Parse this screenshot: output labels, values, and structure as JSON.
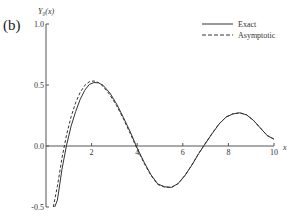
{
  "panel_label": "(b)",
  "chart_data": {
    "type": "line",
    "title": "",
    "xlabel": "x",
    "ylabel": "Y₀(x)",
    "xlim": [
      0,
      10
    ],
    "ylim": [
      -0.5,
      1.0
    ],
    "xticks": [
      2,
      4,
      6,
      8,
      10
    ],
    "xtick_labels": [
      "2",
      "4",
      "6",
      "8",
      "10"
    ],
    "yticks": [
      -0.5,
      0.0,
      0.5,
      1.0
    ],
    "ytick_labels": [
      "-0.5",
      "0.0",
      "0.5",
      "1.0"
    ],
    "grid": false,
    "legend_position": "top-right",
    "series": [
      {
        "name": "Exact",
        "style": "solid",
        "x": [
          0.38,
          0.5,
          0.7,
          0.9,
          1.1,
          1.3,
          1.5,
          1.7,
          1.9,
          2.1,
          2.3,
          2.5,
          2.8,
          3.1,
          3.4,
          3.7,
          4.0,
          4.3,
          4.6,
          4.9,
          5.2,
          5.5,
          5.8,
          6.1,
          6.4,
          6.7,
          7.0,
          7.3,
          7.6,
          7.9,
          8.2,
          8.5,
          8.8,
          9.1,
          9.4,
          9.7,
          10.0
        ],
        "y": [
          -0.5,
          -0.444,
          -0.191,
          0.006,
          0.162,
          0.282,
          0.382,
          0.457,
          0.505,
          0.52,
          0.518,
          0.498,
          0.435,
          0.343,
          0.232,
          0.114,
          -0.017,
          -0.132,
          -0.235,
          -0.311,
          -0.334,
          -0.339,
          -0.307,
          -0.24,
          -0.156,
          -0.062,
          0.023,
          0.105,
          0.182,
          0.237,
          0.263,
          0.272,
          0.255,
          0.21,
          0.148,
          0.086,
          0.056
        ]
      },
      {
        "name": "Asymptotic",
        "style": "dashed",
        "x": [
          0.32,
          0.5,
          0.7,
          0.9,
          1.1,
          1.3,
          1.5,
          1.7,
          1.9,
          2.1,
          2.3,
          2.5,
          2.8,
          3.1,
          3.4,
          3.7,
          4.0,
          4.3,
          4.6,
          4.9,
          5.2,
          5.5,
          5.8,
          6.1,
          6.4,
          6.7,
          7.0,
          7.3,
          7.6,
          7.9,
          8.2,
          8.5,
          8.8,
          9.1,
          9.4,
          9.7,
          10.0
        ],
        "y": [
          -0.5,
          -0.33,
          -0.1,
          0.09,
          0.24,
          0.355,
          0.44,
          0.497,
          0.527,
          0.533,
          0.52,
          0.49,
          0.42,
          0.33,
          0.22,
          0.1,
          -0.025,
          -0.14,
          -0.24,
          -0.315,
          -0.337,
          -0.34,
          -0.308,
          -0.24,
          -0.155,
          -0.06,
          0.025,
          0.107,
          0.183,
          0.238,
          0.264,
          0.272,
          0.255,
          0.21,
          0.148,
          0.086,
          0.056
        ]
      }
    ]
  }
}
